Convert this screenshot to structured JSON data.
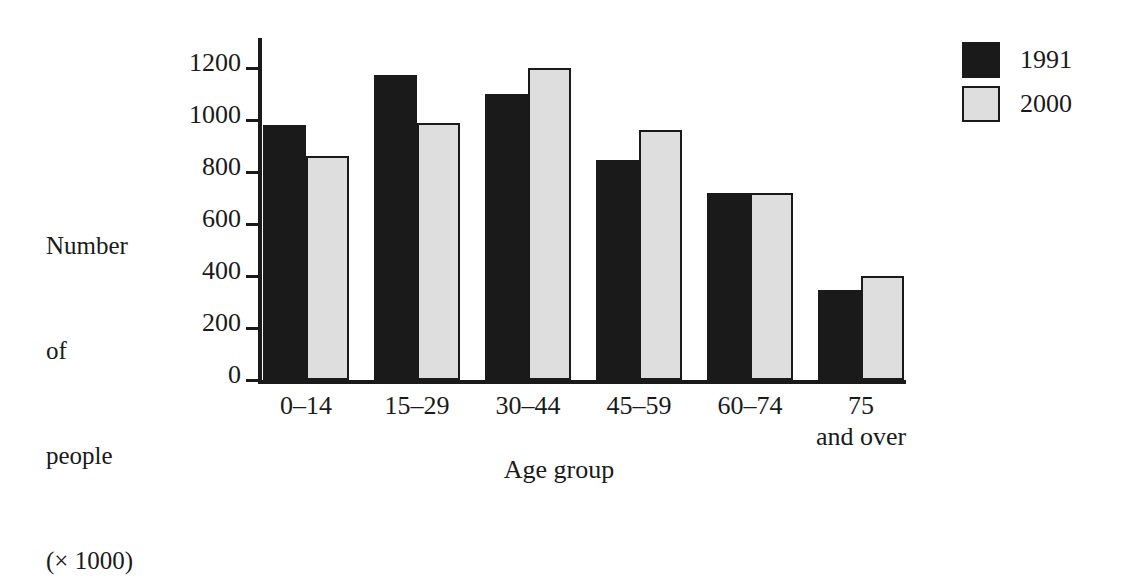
{
  "chart_data": {
    "type": "bar",
    "title": "",
    "xlabel": "Age group",
    "ylabel": "Number of people (× 1000)",
    "ylabel_lines": [
      "Number",
      "of",
      "people",
      "(× 1000)"
    ],
    "categories": [
      "0–14",
      "15–29",
      "30–44",
      "45–59",
      "60–74",
      "75\nand over"
    ],
    "category_labels_flat": [
      "0–14",
      "15–29",
      "30–44",
      "45–59",
      "60–74",
      "75 and over"
    ],
    "series": [
      {
        "name": "1991",
        "color": "#1a1a1a",
        "values": [
          980,
          1175,
          1100,
          845,
          720,
          345
        ]
      },
      {
        "name": "2000",
        "color": "#dedede",
        "values": [
          860,
          990,
          1200,
          960,
          720,
          400
        ]
      }
    ],
    "ylim": [
      0,
      1260
    ],
    "yticks": [
      0,
      200,
      400,
      600,
      800,
      1000,
      1200
    ],
    "ytick_labels": [
      "0",
      "200",
      "400",
      "600",
      "800",
      "1000",
      "1200"
    ],
    "grid": false,
    "legend": {
      "position": "top-right",
      "entries": [
        {
          "label": "1991",
          "swatch": "black-square-swatch"
        },
        {
          "label": "2000",
          "swatch": "gray-square-swatch"
        }
      ]
    },
    "axis_color": "#1a1a1a",
    "background": "#ffffff"
  }
}
